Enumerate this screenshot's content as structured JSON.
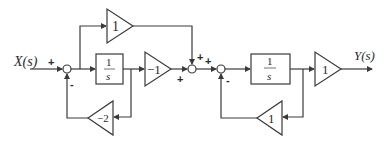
{
  "diagram": {
    "input_label": "X(s)",
    "output_label": "Y(s)",
    "colors": {
      "line": "#3a3a3a",
      "text": "#2a2a2a",
      "background": "#ffffff"
    },
    "blocks": {
      "feedforward_gain": "1",
      "integrator1_num": "1",
      "integrator1_den": "s",
      "gain_neg1": "−1",
      "feedback_gain1": "−2",
      "integrator2_num": "1",
      "integrator2_den": "s",
      "output_gain": "1",
      "feedback_gain2": "1"
    },
    "signs": {
      "sum1_input": "+",
      "sum1_feedback": "-",
      "sum2_top": "+",
      "sum2_left": "+",
      "sum3_left": "+",
      "sum3_feedback": "-"
    }
  }
}
